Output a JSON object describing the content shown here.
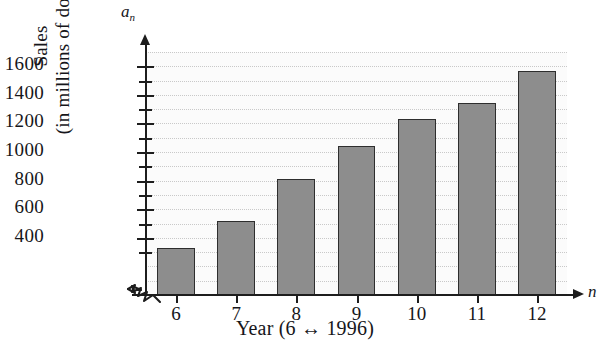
{
  "chart_data": {
    "type": "bar",
    "title": "",
    "subtitle": "",
    "xlabel": "Year (6 ↔ 1996)",
    "ylabel": "Sales",
    "ylabel_line2": "(in millions of dollars)",
    "x_axis_variable": "n",
    "y_axis_variable": "a",
    "y_axis_variable_sub": "n",
    "categories": [
      "6",
      "7",
      "8",
      "9",
      "10",
      "11",
      "12"
    ],
    "values": [
      330,
      520,
      810,
      1040,
      1230,
      1345,
      1570
    ],
    "xlim": [
      5.5,
      12.5
    ],
    "ylim": [
      0,
      1700
    ],
    "y_major_ticks": [
      400,
      600,
      800,
      1000,
      1200,
      1400,
      1600
    ],
    "y_minor_ticks": [
      300,
      500,
      700,
      900,
      1100,
      1300,
      1500
    ],
    "y_tick_labels": [
      "400",
      "600",
      "800",
      "1000",
      "1200",
      "1400",
      "1600"
    ],
    "y_tick_interval": 100,
    "grid": true,
    "grid_axis": "y",
    "legend": "none",
    "axis_break": true,
    "axis_break_symbol": "zigzag",
    "colors": {
      "bar_fill": "#8d8d8d",
      "bar_stroke": "#2e2e2e",
      "axis": "#1d1d1d",
      "grid": "#c9c9c9",
      "plot_background": "#fbfbfb",
      "text": "#16161a"
    }
  }
}
